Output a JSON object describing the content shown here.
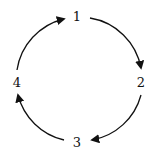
{
  "diagram": {
    "type": "cycle",
    "nodes": [
      {
        "id": "1",
        "label": "1",
        "x": 77,
        "y": 21
      },
      {
        "id": "2",
        "label": "2",
        "x": 141,
        "y": 86
      },
      {
        "id": "3",
        "label": "3",
        "x": 77,
        "y": 146
      },
      {
        "id": "4",
        "label": "4",
        "x": 17,
        "y": 86
      }
    ],
    "edges": [
      {
        "from": "1",
        "to": "2"
      },
      {
        "from": "2",
        "to": "3"
      },
      {
        "from": "3",
        "to": "4"
      },
      {
        "from": "4",
        "to": "1"
      }
    ],
    "colors": {
      "stroke": "#111111",
      "background": "#ffffff"
    }
  }
}
